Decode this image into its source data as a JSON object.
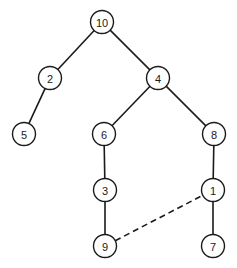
{
  "diagram": {
    "type": "tree",
    "nodes": [
      {
        "id": "10",
        "label": "10",
        "x": 102,
        "y": 22
      },
      {
        "id": "2",
        "label": "2",
        "x": 50,
        "y": 78
      },
      {
        "id": "4",
        "label": "4",
        "x": 158,
        "y": 78
      },
      {
        "id": "5",
        "label": "5",
        "x": 24,
        "y": 134
      },
      {
        "id": "6",
        "label": "6",
        "x": 104,
        "y": 134
      },
      {
        "id": "8",
        "label": "8",
        "x": 214,
        "y": 134
      },
      {
        "id": "3",
        "label": "3",
        "x": 105,
        "y": 190
      },
      {
        "id": "1",
        "label": "1",
        "x": 213,
        "y": 190
      },
      {
        "id": "9",
        "label": "9",
        "x": 105,
        "y": 246
      },
      {
        "id": "7",
        "label": "7",
        "x": 213,
        "y": 246
      }
    ],
    "edges": [
      {
        "from": "10",
        "to": "2",
        "style": "solid"
      },
      {
        "from": "10",
        "to": "4",
        "style": "solid"
      },
      {
        "from": "2",
        "to": "5",
        "style": "solid"
      },
      {
        "from": "4",
        "to": "6",
        "style": "solid"
      },
      {
        "from": "4",
        "to": "8",
        "style": "solid"
      },
      {
        "from": "6",
        "to": "3",
        "style": "solid"
      },
      {
        "from": "3",
        "to": "9",
        "style": "solid"
      },
      {
        "from": "8",
        "to": "1",
        "style": "solid"
      },
      {
        "from": "1",
        "to": "7",
        "style": "solid"
      },
      {
        "from": "9",
        "to": "1",
        "style": "dashed"
      }
    ],
    "node_radius": 11.5
  }
}
